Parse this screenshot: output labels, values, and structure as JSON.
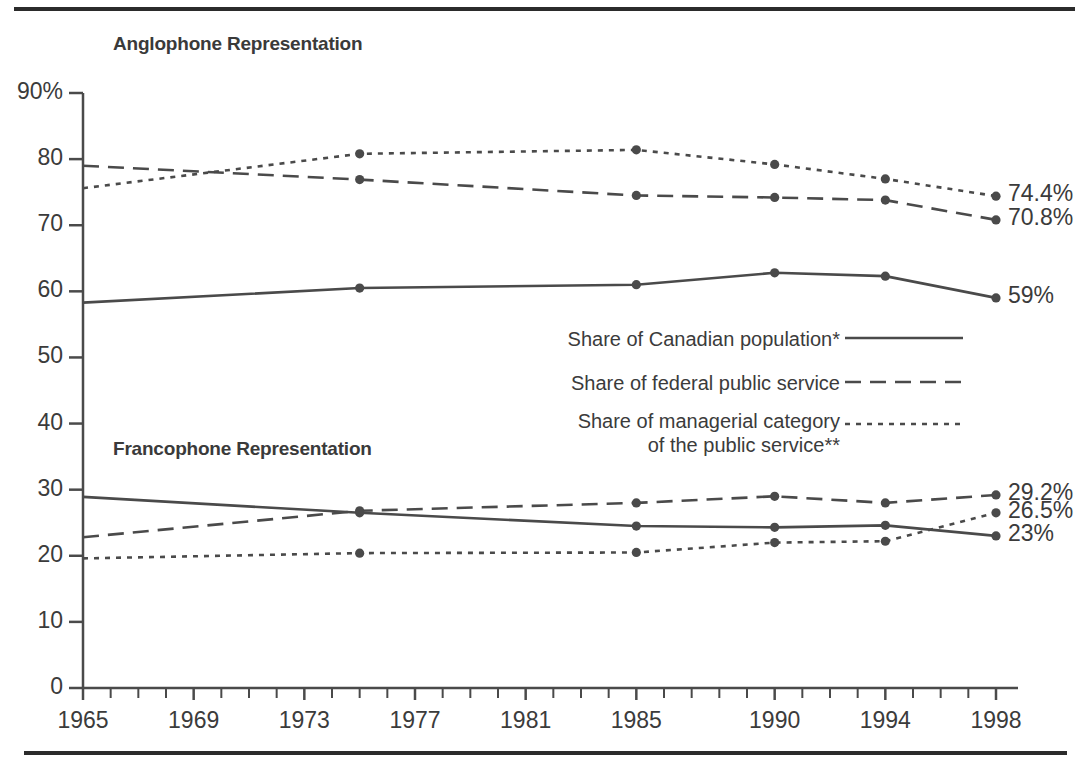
{
  "figure": {
    "group_titles": {
      "anglophone": "Anglophone Representation",
      "francophone": "Francophone Representation"
    }
  },
  "legend": {
    "position": "center-right",
    "items": [
      {
        "label": "Share of Canadian population*",
        "style": "solid"
      },
      {
        "label": "Share of federal public service",
        "style": "dashed"
      },
      {
        "label": "Share of managerial category",
        "label_line2": " of the public service**",
        "style": "dotted"
      }
    ]
  },
  "chart_data": {
    "type": "line",
    "title": "",
    "xlabel": "",
    "ylabel": "",
    "xlim": [
      1965,
      1998
    ],
    "ylim": [
      0,
      90
    ],
    "grid": false,
    "y_ticks": [
      0,
      10,
      20,
      30,
      40,
      50,
      60,
      70,
      80,
      90
    ],
    "y_tick_labels": [
      "0",
      "10",
      "20",
      "30",
      "40",
      "50",
      "60",
      "70",
      "80",
      "90%"
    ],
    "x_ticks": [
      1965,
      1969,
      1973,
      1977,
      1981,
      1985,
      1990,
      1994,
      1998
    ],
    "x_tick_labels": [
      "1965",
      "1969",
      "1973",
      "1977",
      "1981",
      "1985",
      "1990",
      "1994",
      "1998"
    ],
    "x_minor_tick_step": 1,
    "marker_years": [
      1975,
      1985,
      1990,
      1994,
      1998
    ],
    "x": [
      1965,
      1975,
      1985,
      1990,
      1994,
      1998
    ],
    "groups": [
      {
        "name": "Anglophone Representation",
        "series": [
          {
            "name": "Share of Canadian population*",
            "style": "solid",
            "values": [
              58.3,
              60.5,
              61.0,
              62.8,
              62.3,
              59.0
            ],
            "end_label": "59%"
          },
          {
            "name": "Share of federal public service",
            "style": "dashed",
            "values": [
              79.0,
              76.9,
              74.5,
              74.2,
              73.8,
              70.8
            ],
            "end_label": "70.8%"
          },
          {
            "name": "Share of managerial category of the public service**",
            "style": "dotted",
            "values": [
              75.6,
              80.8,
              81.4,
              79.2,
              77.0,
              74.4
            ],
            "end_label": "74.4%"
          }
        ]
      },
      {
        "name": "Francophone Representation",
        "series": [
          {
            "name": "Share of Canadian population*",
            "style": "solid",
            "values": [
              28.9,
              26.5,
              24.5,
              24.3,
              24.6,
              23.0
            ],
            "end_label": "23%"
          },
          {
            "name": "Share of federal public service",
            "style": "dashed",
            "values": [
              22.8,
              26.8,
              28.0,
              29.0,
              28.0,
              29.2
            ],
            "end_label": "29.2%"
          },
          {
            "name": "Share of managerial category of the public service**",
            "style": "dotted",
            "values": [
              19.6,
              20.4,
              20.5,
              22.0,
              22.2,
              26.5
            ],
            "end_label": "26.5%"
          }
        ]
      }
    ],
    "end_labels": {
      "anglophone_managerial": "74.4%",
      "anglophone_federal": "70.8%",
      "anglophone_population": "59%",
      "francophone_federal": "29.2%",
      "francophone_managerial": "26.5%",
      "francophone_population": "23%"
    },
    "colors": {
      "line": "#4a4a4a",
      "text": "#3b3b3b",
      "rule": "#2b2b2b"
    }
  }
}
